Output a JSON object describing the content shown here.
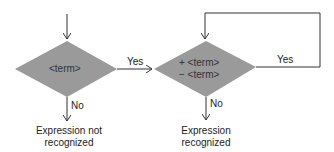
{
  "colors": {
    "diamond_fill": "#9a9a9a",
    "line": "#333333",
    "text": "#222222"
  },
  "left_decision": {
    "text": "<term>",
    "yes_label": "Yes",
    "no_label": "No",
    "no_outcome_line1": "Expression not",
    "no_outcome_line2": "recognized"
  },
  "right_decision": {
    "line1": "+ <term>",
    "line2": "− <term>",
    "yes_label": "Yes",
    "no_label": "No",
    "no_outcome_line1": "Expression",
    "no_outcome_line2": "recognized"
  }
}
